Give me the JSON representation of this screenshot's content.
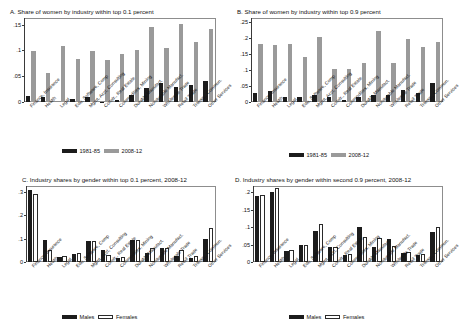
{
  "figure": {
    "categories": [
      "Finance, Insurance",
      "Health",
      "Legal",
      "Edu, Software, Comp",
      "Mgmt, Acct, Consulting",
      "Constr., Real Estate",
      "Commodities, Mining",
      "Durable Manufact.",
      "Nondurable Manufact.",
      "Wholesale Trade",
      "Retail Trade",
      "Transp., Commun.",
      "Other Services"
    ],
    "colors": {
      "dark": "#1c1c1c",
      "grey": "#9a9a9a",
      "hollow": "#ffffff",
      "axis": "#3a3a3a",
      "frame": "#8d8d8d"
    }
  },
  "chart_data": [
    {
      "id": "panel-a",
      "type": "bar",
      "title": "A. Share of women by industry within top 0.1 percent",
      "xlabel": "",
      "ylabel": "",
      "ylim": [
        0,
        0.163
      ],
      "yticks": [
        0,
        0.05,
        0.1,
        0.15
      ],
      "ytick_labels": [
        "0",
        ".05",
        ".1",
        ".15"
      ],
      "grid": false,
      "legend_position": "bottom-center",
      "categories": [
        "Finance, Insurance",
        "Health",
        "Legal",
        "Edu, Software, Comp",
        "Mgmt, Acct, Consulting",
        "Constr., Real Estate",
        "Commodities, Mining",
        "Durable Manufact.",
        "Nondurable Manufact.",
        "Wholesale Trade",
        "Retail Trade",
        "Transp., Commun.",
        "Other Services"
      ],
      "series": [
        {
          "name": "1981-85",
          "values": [
            0.012,
            0.01,
            0.0,
            0.005,
            0.009,
            0.001,
            0.003,
            0.013,
            0.027,
            0.036,
            0.029,
            0.033,
            0.041
          ]
        },
        {
          "name": "2008-12",
          "values": [
            0.099,
            0.057,
            0.108,
            0.083,
            0.099,
            0.082,
            0.093,
            0.1,
            0.145,
            0.104,
            0.151,
            0.117,
            0.142
          ]
        }
      ]
    },
    {
      "id": "panel-b",
      "type": "bar",
      "title": "B. Share of women by industry within top 0.9 percent",
      "xlabel": "",
      "ylabel": "",
      "ylim": [
        0,
        0.262
      ],
      "yticks": [
        0,
        0.05,
        0.1,
        0.15,
        0.2,
        0.25
      ],
      "ytick_labels": [
        "0",
        ".05",
        ".1",
        ".15",
        ".2",
        ".25"
      ],
      "grid": false,
      "legend_position": "bottom-center",
      "categories": [
        "Finance, Insurance",
        "Health",
        "Legal",
        "Edu, Software, Comp",
        "Mgmt, Acct, Consulting",
        "Constr., Real Estate",
        "Commodities, Mining",
        "Durable Manufact.",
        "Nondurable Manufact.",
        "Wholesale Trade",
        "Retail Trade",
        "Transp., Commun.",
        "Other Services"
      ],
      "series": [
        {
          "name": "1981-85",
          "values": [
            0.028,
            0.035,
            0.017,
            0.015,
            0.023,
            0.016,
            0.007,
            0.015,
            0.023,
            0.023,
            0.036,
            0.028,
            0.058
          ]
        },
        {
          "name": "2008-12",
          "values": [
            0.18,
            0.178,
            0.18,
            0.14,
            0.203,
            0.103,
            0.102,
            0.123,
            0.222,
            0.121,
            0.198,
            0.172,
            0.186
          ]
        }
      ]
    },
    {
      "id": "panel-c",
      "type": "bar",
      "title": "C. Industry shares by gender within top 0.1 percent, 2008-12",
      "xlabel": "",
      "ylabel": "",
      "ylim": [
        0,
        0.325
      ],
      "yticks": [
        0,
        0.1,
        0.2,
        0.3
      ],
      "ytick_labels": [
        "0",
        ".1",
        ".2",
        ".3"
      ],
      "grid": false,
      "legend_position": "bottom-center",
      "categories": [
        "Finance, Insurance",
        "Health",
        "Legal",
        "Edu, Software, Comp",
        "Mgmt, Acct, Consulting",
        "Constr., Real Estate",
        "Commodities, Mining",
        "Durable Manufact.",
        "Nondurable Manufact.",
        "Wholesale Trade",
        "Retail Trade",
        "Transp., Commun.",
        "Other Services"
      ],
      "series": [
        {
          "name": "Males",
          "values": [
            0.308,
            0.095,
            0.021,
            0.033,
            0.091,
            0.052,
            0.019,
            0.095,
            0.04,
            0.058,
            0.027,
            0.017,
            0.1
          ]
        },
        {
          "name": "Females",
          "values": [
            0.29,
            0.05,
            0.024,
            0.038,
            0.09,
            0.03,
            0.021,
            0.093,
            0.062,
            0.06,
            0.051,
            0.025,
            0.145
          ]
        }
      ]
    },
    {
      "id": "panel-d",
      "type": "bar",
      "title": "D. Industry shares by gender within second 0.9 percent, 2008-12",
      "xlabel": "",
      "ylabel": "",
      "ylim": [
        0,
        0.218
      ],
      "yticks": [
        0,
        0.05,
        0.1,
        0.15,
        0.2
      ],
      "ytick_labels": [
        "0",
        ".05",
        ".1",
        ".15",
        ".2"
      ],
      "grid": false,
      "legend_position": "bottom-center",
      "categories": [
        "Finance, Insurance",
        "Health",
        "Legal",
        "Edu, Software, Comp",
        "Mgmt, Acct, Consulting",
        "Constr., Real Estate",
        "Commodities, Mining",
        "Durable Manufact.",
        "Nondurable Manufact.",
        "Wholesale Trade",
        "Retail Trade",
        "Transp., Commun.",
        "Other Services"
      ],
      "series": [
        {
          "name": "Males",
          "values": [
            0.19,
            0.201,
            0.032,
            0.049,
            0.088,
            0.044,
            0.021,
            0.101,
            0.043,
            0.065,
            0.027,
            0.021,
            0.086
          ]
        },
        {
          "name": "Females",
          "values": [
            0.193,
            0.212,
            0.035,
            0.05,
            0.11,
            0.044,
            0.023,
            0.071,
            0.068,
            0.046,
            0.029,
            0.024,
            0.1
          ]
        }
      ]
    }
  ],
  "legends": {
    "ab": [
      {
        "label": "1981-85",
        "style": "dark"
      },
      {
        "label": "2008-12",
        "style": "grey"
      }
    ],
    "cd": [
      {
        "label": "Males",
        "style": "dark"
      },
      {
        "label": "Females",
        "style": "hollow"
      }
    ]
  }
}
